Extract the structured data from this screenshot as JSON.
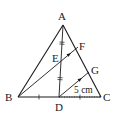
{
  "diagram": {
    "type": "triangle-geometry",
    "colors": {
      "stroke": "#1a1a1a",
      "background": "#ffffff"
    },
    "points": {
      "A": {
        "label": "A",
        "x": 63,
        "y": 25
      },
      "B": {
        "label": "B",
        "x": 18,
        "y": 97
      },
      "C": {
        "label": "C",
        "x": 101,
        "y": 97
      },
      "D": {
        "label": "D",
        "x": 59,
        "y": 97
      },
      "E": {
        "label": "E",
        "x": 61,
        "y": 61
      },
      "F": {
        "label": "F",
        "x": 78,
        "y": 47
      },
      "G": {
        "label": "G",
        "x": 89,
        "y": 72
      }
    },
    "segments": [
      "AB",
      "AC",
      "BC",
      "AD",
      "BF",
      "DG"
    ],
    "dotted_segments": [
      "DC"
    ],
    "equal_marks": {
      "AE_ED": "double tick",
      "BD_DC": "single tick"
    },
    "parallel_arrows": [
      "EF",
      "DG"
    ],
    "measurement": {
      "segment": "DG",
      "text": "5 cm"
    }
  }
}
